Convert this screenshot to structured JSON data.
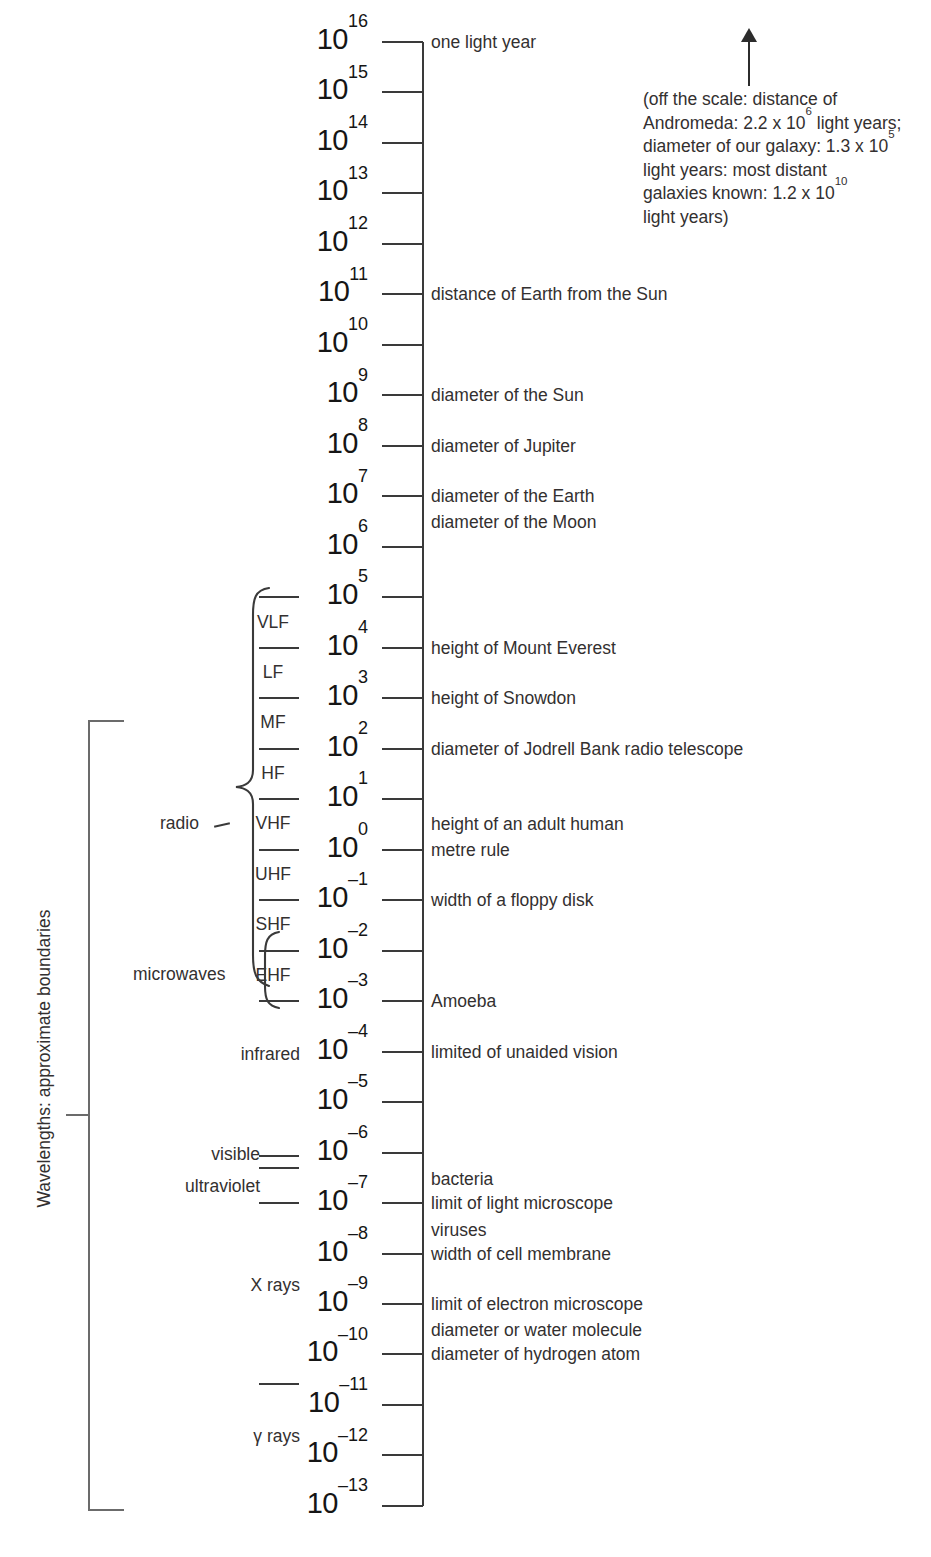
{
  "chart_data": {
    "type": "table",
    "axis_label": "Wavelengths: approximate boundaries",
    "scale_units": "metres (powers of ten)",
    "axis_top_exponent": 16,
    "axis_bottom_exponent": -13,
    "decades": [
      {
        "exp": 16,
        "label": "10",
        "sup": "16"
      },
      {
        "exp": 15,
        "label": "10",
        "sup": "15"
      },
      {
        "exp": 14,
        "label": "10",
        "sup": "14"
      },
      {
        "exp": 13,
        "label": "10",
        "sup": "13"
      },
      {
        "exp": 12,
        "label": "10",
        "sup": "12"
      },
      {
        "exp": 11,
        "label": "10",
        "sup": "11"
      },
      {
        "exp": 10,
        "label": "10",
        "sup": "10"
      },
      {
        "exp": 9,
        "label": "10",
        "sup": "9"
      },
      {
        "exp": 8,
        "label": "10",
        "sup": "8"
      },
      {
        "exp": 7,
        "label": "10",
        "sup": "7"
      },
      {
        "exp": 6,
        "label": "10",
        "sup": "6"
      },
      {
        "exp": 5,
        "label": "10",
        "sup": "5"
      },
      {
        "exp": 4,
        "label": "10",
        "sup": "4"
      },
      {
        "exp": 3,
        "label": "10",
        "sup": "3"
      },
      {
        "exp": 2,
        "label": "10",
        "sup": "2"
      },
      {
        "exp": 1,
        "label": "10",
        "sup": "1"
      },
      {
        "exp": 0,
        "label": "10",
        "sup": "0"
      },
      {
        "exp": -1,
        "label": "10",
        "sup": "–1"
      },
      {
        "exp": -2,
        "label": "10",
        "sup": "–2"
      },
      {
        "exp": -3,
        "label": "10",
        "sup": "–3"
      },
      {
        "exp": -4,
        "label": "10",
        "sup": "–4"
      },
      {
        "exp": -5,
        "label": "10",
        "sup": "–5"
      },
      {
        "exp": -6,
        "label": "10",
        "sup": "–6"
      },
      {
        "exp": -7,
        "label": "10",
        "sup": "–7"
      },
      {
        "exp": -8,
        "label": "10",
        "sup": "–8"
      },
      {
        "exp": -9,
        "label": "10",
        "sup": "–9"
      },
      {
        "exp": -10,
        "label": "10",
        "sup": "–10"
      },
      {
        "exp": -11,
        "label": "10",
        "sup": "–11"
      },
      {
        "exp": -12,
        "label": "10",
        "sup": "–12"
      },
      {
        "exp": -13,
        "label": "10",
        "sup": "–13"
      }
    ],
    "reference_objects": [
      {
        "exp": 16,
        "text": "one light year"
      },
      {
        "exp": 11,
        "text": "distance of Earth from the Sun"
      },
      {
        "exp": 9,
        "text": "diameter of the Sun"
      },
      {
        "exp": 8,
        "text": "diameter of Jupiter"
      },
      {
        "exp": 7,
        "text": "diameter of the Earth"
      },
      {
        "exp": 7,
        "text": "diameter of the Moon",
        "offset": 26
      },
      {
        "exp": 4,
        "text": "height of Mount Everest"
      },
      {
        "exp": 3,
        "text": "height of Snowdon"
      },
      {
        "exp": 2,
        "text": "diameter of Jodrell Bank radio telescope"
      },
      {
        "exp": 0,
        "text": "height of an adult human",
        "offset": -26
      },
      {
        "exp": 0,
        "text": "metre rule"
      },
      {
        "exp": -1,
        "text": "width of a floppy disk"
      },
      {
        "exp": -3,
        "text": "Amoeba"
      },
      {
        "exp": -4,
        "text": "limited of unaided vision"
      },
      {
        "exp": -7,
        "text": "bacteria",
        "offset": -24
      },
      {
        "exp": -7,
        "text": "limit of light microscope"
      },
      {
        "exp": -8,
        "text": "viruses",
        "offset": -24
      },
      {
        "exp": -8,
        "text": "width of cell membrane"
      },
      {
        "exp": -9,
        "text": "limit of electron microscope"
      },
      {
        "exp": -10,
        "text": "diameter or water molecule",
        "offset": -24
      },
      {
        "exp": -10,
        "text": "diameter of hydrogen atom"
      }
    ],
    "radio_bands": [
      {
        "name": "VLF",
        "between": [
          5,
          4
        ]
      },
      {
        "name": "LF",
        "between": [
          4,
          3
        ]
      },
      {
        "name": "MF",
        "between": [
          3,
          2
        ]
      },
      {
        "name": "HF",
        "between": [
          2,
          1
        ]
      },
      {
        "name": "VHF",
        "between": [
          1,
          0
        ]
      },
      {
        "name": "UHF",
        "between": [
          0,
          -1
        ]
      },
      {
        "name": "SHF",
        "between": [
          -1,
          -2
        ]
      },
      {
        "name": "EHF",
        "between": [
          -2,
          -3
        ]
      }
    ],
    "spectrum_regions": [
      {
        "name": "radio",
        "from_exp": 5,
        "to_exp": -3
      },
      {
        "name": "microwaves",
        "from_exp": -2,
        "to_exp": -3
      },
      {
        "name": "infrared",
        "from_exp": -3,
        "to_exp": -6
      },
      {
        "name": "visible",
        "from_exp": -6,
        "to_exp": -6.4
      },
      {
        "name": "ultraviolet",
        "from_exp": -6.4,
        "to_exp": -7
      },
      {
        "name": "X rays",
        "from_exp": -9,
        "to_exp": -11
      },
      {
        "name": "γ rays",
        "from_exp": -11,
        "to_exp": -13
      }
    ],
    "annotation": {
      "lines": [
        "(off the scale: distance of",
        "Andromeda: 2.2 x 10⁶ light years;",
        "diameter of our galaxy: 1.3 x 10⁵",
        "light years: most distant",
        "galaxies known: 1.2 x 10¹⁰",
        "light years)"
      ],
      "values": [
        {
          "label": "distance of Andromeda",
          "mantissa": 2.2,
          "exponent": 6,
          "unit": "light years"
        },
        {
          "label": "diameter of our galaxy",
          "mantissa": 1.3,
          "exponent": 5,
          "unit": "light years"
        },
        {
          "label": "most distant galaxies known",
          "mantissa": 1.2,
          "exponent": 10,
          "unit": "light years"
        }
      ]
    },
    "colors": {
      "ink": "#231f20",
      "line": "#3a3a3a",
      "bracket": "#6b6b6b",
      "background": "#ffffff"
    }
  },
  "annotation_text": {
    "l1": "(off the scale: distance of",
    "l2a": "Andromeda: 2.2 x 10",
    "l2b": "6",
    "l2c": " light years;",
    "l3a": "diameter of our galaxy: 1.3 x 10",
    "l3b": "5",
    "l4": "light years: most distant",
    "l5a": "galaxies known: 1.2 x 10",
    "l5b": "10",
    "l6": "light years)"
  },
  "labels": {
    "axis_title": "Wavelengths: approximate boundaries",
    "radio": "radio",
    "microwaves": "microwaves",
    "infrared": "infrared",
    "visible": "visible",
    "ultraviolet": "ultraviolet",
    "xrays": "X rays",
    "gammarays": "γ rays"
  }
}
